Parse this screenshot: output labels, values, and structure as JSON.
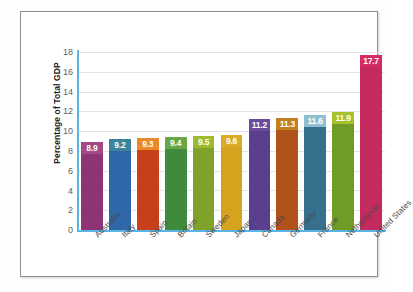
{
  "chart_data": {
    "type": "bar",
    "title": "",
    "subtitle": "",
    "xlabel": "",
    "ylabel": "Percentage of Total GDP",
    "ylim": [
      0,
      18
    ],
    "ytick_step": 2,
    "yticks": [
      "18",
      "16",
      "14",
      "12",
      "10",
      "8",
      "6",
      "4",
      "2",
      "0"
    ],
    "grid": "horizontal",
    "legend": "none",
    "categories": [
      "Australia",
      "Italy",
      "Spain",
      "Britain",
      "Sweden",
      "Japan",
      "Canada",
      "Germany",
      "France",
      "Netherlands",
      "United States"
    ],
    "values": [
      8.9,
      9.2,
      9.3,
      9.4,
      9.5,
      9.6,
      11.2,
      11.3,
      11.6,
      11.9,
      17.7
    ],
    "value_labels": [
      "8.9",
      "9.2",
      "9.3",
      "9.4",
      "9.5",
      "9.6",
      "11.2",
      "11.3",
      "11.6",
      "11.9",
      "17.7"
    ],
    "bar_colors": [
      "#8e3375",
      "#2e68a8",
      "#c8401a",
      "#3f8a3c",
      "#7fa32a",
      "#d6a31d",
      "#5a3f8e",
      "#b1521a",
      "#36708c",
      "#6f9b26",
      "#c32a5e"
    ],
    "bar_label_colors": [
      "#a24a86",
      "#3c8499",
      "#e8892a",
      "#67a845",
      "#9dbb2f",
      "#dcab28",
      "#6b4a9c",
      "#c2801f",
      "#8fc0d2",
      "#a8c02c",
      "#d62b63"
    ],
    "value_label_text_color": "#ffffff",
    "axis_color": "#5ab4e5",
    "gridline_color": "#e4e4e4",
    "plot_background": "#ffffff",
    "frame_border_color": "#8f8f8f"
  }
}
